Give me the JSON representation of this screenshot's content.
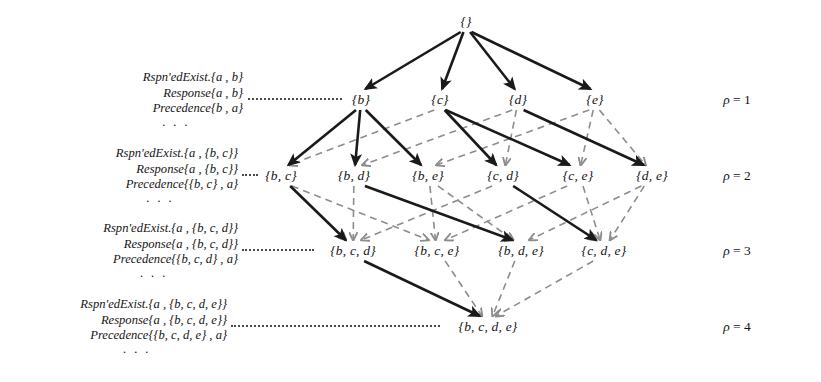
{
  "figure": {
    "type": "lattice-diagram",
    "background": "#ffffff",
    "ink_color": "#141414",
    "solid_edge_color": "#1a1a1a",
    "dashed_edge_color": "#8d8d8d",
    "root": {
      "label": "{}",
      "x": 466,
      "y": 22
    },
    "levels": [
      {
        "rho": 1,
        "rho_label": "ρ = 1",
        "rho_x": 737,
        "y": 100,
        "nodes": [
          {
            "id": "b",
            "label": "{b}",
            "x": 361
          },
          {
            "id": "c",
            "label": "{c}",
            "x": 440
          },
          {
            "id": "d",
            "label": "{d}",
            "x": 518
          },
          {
            "id": "e",
            "label": "{e}",
            "x": 595
          }
        ],
        "formula": {
          "x": 243,
          "y": 70,
          "lines": [
            "Rspn'edExist.{a ,  b}",
            "Response{a ,  b}",
            "Precedence{b ,  a}"
          ],
          "ellipsis": "· · ·",
          "leader_from_x": 248,
          "leader_to_x": 342,
          "leader_y": 100
        }
      },
      {
        "rho": 2,
        "rho_label": "ρ = 2",
        "rho_x": 737,
        "y": 176,
        "nodes": [
          {
            "id": "bc",
            "label": "{b, c}",
            "x": 281
          },
          {
            "id": "bd",
            "label": "{b, d}",
            "x": 354
          },
          {
            "id": "be",
            "label": "{b, e}",
            "x": 428
          },
          {
            "id": "cd",
            "label": "{c, d}",
            "x": 503
          },
          {
            "id": "ce",
            "label": "{c, e}",
            "x": 578
          },
          {
            "id": "de",
            "label": "{d, e}",
            "x": 652
          }
        ],
        "formula": {
          "x": 238,
          "y": 146,
          "lines": [
            "Rspn'edExist.{a ,  {b, c}}",
            "Response{a ,  {b, c}}",
            "Precedence{{b, c} ,  a}"
          ],
          "ellipsis": "· · ·",
          "leader_from_x": 242,
          "leader_to_x": 258,
          "leader_y": 176
        }
      },
      {
        "rho": 3,
        "rho_label": "ρ = 3",
        "rho_x": 737,
        "y": 251,
        "nodes": [
          {
            "id": "bcd",
            "label": "{b, c, d}",
            "x": 353
          },
          {
            "id": "bce",
            "label": "{b, c, e}",
            "x": 437
          },
          {
            "id": "bde",
            "label": "{b, d, e}",
            "x": 521
          },
          {
            "id": "cde",
            "label": "{c, d, e}",
            "x": 604
          }
        ],
        "formula": {
          "x": 238,
          "y": 221,
          "lines": [
            "Rspn'edExist.{a ,  {b, c, d}}",
            "Response{a ,  {b, c, d}}",
            "Precedence{{b, c, d} ,  a}"
          ],
          "ellipsis": "· · ·",
          "leader_from_x": 242,
          "leader_to_x": 314,
          "leader_y": 251
        }
      },
      {
        "rho": 4,
        "rho_label": "ρ = 4",
        "rho_x": 737,
        "y": 327,
        "nodes": [
          {
            "id": "bcde",
            "label": "{b, c, d, e}",
            "x": 488
          }
        ],
        "formula": {
          "x": 227,
          "y": 297,
          "lines": [
            "Rspn'edExist.{a ,  {b, c, d, e}}",
            "Response{a ,  {b, c, d, e}}",
            "Precedence{{b, c, d, e} ,  a}"
          ],
          "ellipsis": "· · ·",
          "leader_from_x": 231,
          "leader_to_x": 440,
          "leader_y": 327
        }
      }
    ],
    "edges": {
      "solid": [
        {
          "from": "root",
          "to": "b"
        },
        {
          "from": "root",
          "to": "c"
        },
        {
          "from": "root",
          "to": "d"
        },
        {
          "from": "root",
          "to": "e"
        },
        {
          "from": "b",
          "to": "bc"
        },
        {
          "from": "b",
          "to": "bd"
        },
        {
          "from": "b",
          "to": "be"
        },
        {
          "from": "c",
          "to": "cd"
        },
        {
          "from": "c",
          "to": "ce"
        },
        {
          "from": "d",
          "to": "de"
        },
        {
          "from": "bc",
          "to": "bcd"
        },
        {
          "from": "bd",
          "to": "bde"
        },
        {
          "from": "cd",
          "to": "cde"
        },
        {
          "from": "bcd",
          "to": "bcde"
        }
      ],
      "dashed": [
        {
          "from": "c",
          "to": "bc"
        },
        {
          "from": "d",
          "to": "bd"
        },
        {
          "from": "d",
          "to": "cd"
        },
        {
          "from": "e",
          "to": "be"
        },
        {
          "from": "e",
          "to": "ce"
        },
        {
          "from": "e",
          "to": "de"
        },
        {
          "from": "bc",
          "to": "bcd"
        },
        {
          "from": "bd",
          "to": "bcd"
        },
        {
          "from": "cd",
          "to": "bcd"
        },
        {
          "from": "bc",
          "to": "bce"
        },
        {
          "from": "be",
          "to": "bce"
        },
        {
          "from": "ce",
          "to": "bce"
        },
        {
          "from": "bd",
          "to": "bde"
        },
        {
          "from": "be",
          "to": "bde"
        },
        {
          "from": "de",
          "to": "bde"
        },
        {
          "from": "cd",
          "to": "cde"
        },
        {
          "from": "ce",
          "to": "cde"
        },
        {
          "from": "de",
          "to": "cde"
        },
        {
          "from": "bce",
          "to": "bcde"
        },
        {
          "from": "bde",
          "to": "bcde"
        },
        {
          "from": "cde",
          "to": "bcde"
        }
      ]
    }
  }
}
